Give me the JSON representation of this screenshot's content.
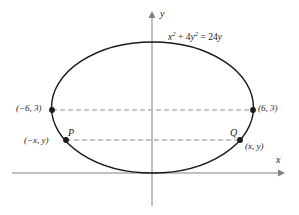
{
  "figure": {
    "kind": "ellipse-graph",
    "axes": {
      "x_label": "x",
      "y_label": "y",
      "origin_label": ""
    },
    "curve": {
      "equation_text": "x2 + 4y2 = 24y",
      "equation_parts": {
        "x_term_base": "x",
        "x_term_exp": "2",
        "plus": " + 4",
        "y_term_base": "y",
        "y_term_exp": "2",
        "equals": " = 24",
        "rhs_var": "y"
      },
      "color": "#1a1a1a"
    },
    "points": [
      {
        "name": "left-vertex",
        "name_label": "",
        "coord_label": "(−6, 3)"
      },
      {
        "name": "right-vertex",
        "name_label": "",
        "coord_label": "(6, 3)"
      },
      {
        "name": "P",
        "name_label": "P",
        "coord_label": "(−x, y)"
      },
      {
        "name": "Q",
        "name_label": "Q",
        "coord_label": "(x, y)"
      }
    ],
    "guide_lines": [
      {
        "name": "chord-through-vertices",
        "style": "dashed",
        "color": "#b0b0b0"
      },
      {
        "name": "chord-through-PQ",
        "style": "dashed",
        "color": "#b0b0b0"
      }
    ],
    "colors": {
      "axis": "#808080",
      "curve": "#1a1a1a",
      "dash": "#b3b3b3",
      "text": "#1a1a1a",
      "background": "#ffffff"
    }
  }
}
